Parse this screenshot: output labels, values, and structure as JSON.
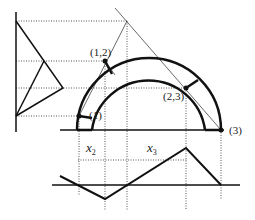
{
  "diagram": {
    "type": "geometric-construction",
    "colors": {
      "stroke": "#111111",
      "dotted": "#555555",
      "background": "#ffffff"
    },
    "points": [
      {
        "id": "p1",
        "label": "(1)",
        "x": 79,
        "y": 116
      },
      {
        "id": "p12",
        "label": "(1,2)",
        "x": 105,
        "y": 61
      },
      {
        "id": "p23",
        "label": "(2,3)",
        "x": 186,
        "y": 88
      },
      {
        "id": "p3",
        "label": "(3)",
        "x": 221,
        "y": 130
      }
    ],
    "dimension_labels": {
      "x2": {
        "base": "x",
        "sub": "2"
      },
      "x3": {
        "base": "x",
        "sub": "3"
      }
    },
    "arcs": {
      "center": [
        149,
        130
      ],
      "outer_radius": 72,
      "inner_radius": 57
    }
  }
}
